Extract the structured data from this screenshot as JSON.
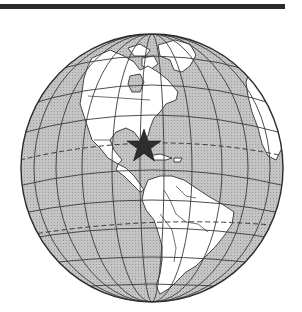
{
  "figure": {
    "colors": {
      "ocean": "#b9b9b9",
      "land": "#ffffff",
      "grid": "#3a3a3a",
      "outline": "#2a2a2a",
      "star": "#2e2e2e",
      "bar": "#2b2b2b"
    },
    "marker": {
      "icon": "star-icon",
      "cx": 144,
      "cy": 146
    },
    "globe": {
      "cx": 152,
      "cy": 168,
      "r": 132
    }
  }
}
